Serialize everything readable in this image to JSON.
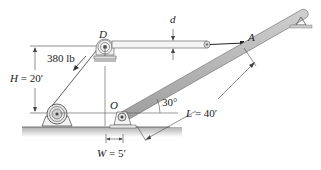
{
  "diagram": {
    "type": "mechanics-boom-winch",
    "labels": {
      "point_d": "D",
      "point_a": "A",
      "point_o": "O",
      "force": "380 lb",
      "height": "H = 20′",
      "height_var": "H",
      "height_val": "= 20′",
      "width_var": "W",
      "width_val": "= 5′",
      "length_var": "L",
      "length_val": "= 40′",
      "angle": "30°",
      "diameter": "d"
    },
    "values": {
      "force_lb": 380,
      "H_ft": 20,
      "W_ft": 5,
      "L_ft": 40,
      "angle_deg": 30
    },
    "colors": {
      "line": "#333333",
      "boom_fill": "#b8b8b8",
      "boom_edge": "#777777",
      "ground": "#c8c8c8",
      "rod_fill": "#e0e0e0"
    }
  }
}
